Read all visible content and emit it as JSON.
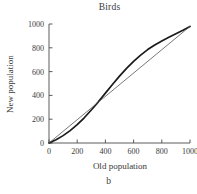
{
  "figure": {
    "title": "Birds",
    "caption": "b",
    "background_color": "#ffffff"
  },
  "chart_data": {
    "type": "line",
    "title": "Birds",
    "xlabel": "Old population",
    "ylabel": "New population",
    "xlim": [
      0,
      1000
    ],
    "ylim": [
      0,
      1000
    ],
    "xticks": [
      0,
      200,
      400,
      600,
      800,
      1000
    ],
    "yticks": [
      0,
      200,
      400,
      600,
      800,
      1000
    ],
    "xtick_labels": [
      "0",
      "200",
      "400",
      "600",
      "800",
      "1000"
    ],
    "ytick_labels": [
      "0",
      "200",
      "400",
      "600",
      "800",
      "1000"
    ],
    "grid": false,
    "legend": false,
    "spines": [
      "left",
      "bottom"
    ],
    "series": [
      {
        "name": "stock-recruitment curve",
        "color": "#1a1a1a",
        "linewidth": 1.7,
        "x": [
          0,
          50,
          100,
          150,
          200,
          250,
          300,
          350,
          400,
          450,
          500,
          550,
          600,
          650,
          700,
          750,
          800,
          850,
          900,
          950,
          1000
        ],
        "y": [
          0,
          28,
          62,
          104,
          154,
          212,
          277,
          346,
          419,
          492,
          562,
          627,
          686,
          739,
          785,
          824,
          858,
          889,
          918,
          948,
          980
        ]
      },
      {
        "name": "replacement line",
        "color": "#555555",
        "linewidth": 0.8,
        "x": [
          0,
          1000
        ],
        "y": [
          0,
          980
        ]
      }
    ],
    "annotations": {
      "crossing_point": [
        250,
        212
      ],
      "convergence_point": [
        1000,
        980
      ]
    }
  }
}
